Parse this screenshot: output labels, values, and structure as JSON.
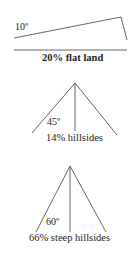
{
  "diagrams": [
    {
      "angle_label": "10º",
      "caption": "20% flat land",
      "shape": "slope"
    },
    {
      "angle_label": "45º",
      "caption": "14% hillsides",
      "shape": "triangle"
    },
    {
      "angle_label": "60º",
      "caption": "66% steep hillsides",
      "shape": "triangle"
    }
  ],
  "colors": {
    "line": "#555555",
    "text": "#1e1e1e",
    "background": "#ffffff"
  }
}
